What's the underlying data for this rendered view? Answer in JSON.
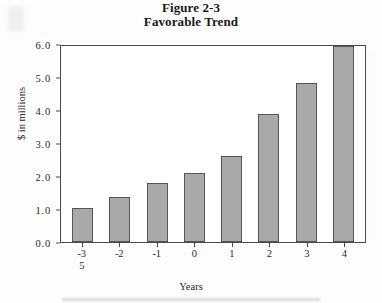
{
  "figure": {
    "title_line_1": "Figure 2-3",
    "title_line_2": "Favorable Trend"
  },
  "chart_data": {
    "type": "bar",
    "title": "Figure 2-3 Favorable Trend",
    "subtitle": "Favorable Trend",
    "xlabel": "Years",
    "ylabel": "$ in millions",
    "categories": [
      "-3",
      "-2",
      "-1",
      "0",
      "1",
      "2",
      "3",
      "4"
    ],
    "values": [
      1.02,
      1.35,
      1.78,
      2.08,
      2.62,
      3.88,
      4.82,
      5.95
    ],
    "ylim": [
      0.0,
      6.0
    ],
    "ytick_labels": [
      "6.0",
      "5.0",
      "4.0",
      "3.0",
      "2.0",
      "1.0",
      "0.0"
    ],
    "ytick_values": [
      6.0,
      5.0,
      4.0,
      3.0,
      2.0,
      1.0,
      0.0
    ],
    "grid": false,
    "legend": "none",
    "bar_color": "#a9a9a9",
    "bar_border_color": "#555555",
    "axis_color": "#4a4a4a",
    "artifacts": {
      "stray_label_under_first_tick": "5"
    }
  }
}
